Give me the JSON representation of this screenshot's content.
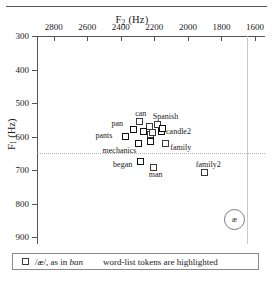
{
  "chart_data": {
    "type": "scatter",
    "title": "",
    "xlabel": "F2 (Hz)",
    "ylabel": "F1 (Hz)",
    "xlabel_main": "F",
    "xlabel_sub": "2",
    "xlabel_unit": " (Hz)",
    "ylabel_main": "F",
    "ylabel_sub": "1",
    "ylabel_unit": " (Hz)",
    "xlim": [
      2900,
      1540
    ],
    "ylim": [
      300,
      920
    ],
    "x_axis_position": "top",
    "y_axis_direction": "inverted",
    "grid": false,
    "legend_position": "below-plot",
    "xticks": [
      2800,
      2600,
      2400,
      2200,
      2000,
      1800,
      1600
    ],
    "xtick_labels": [
      "2800",
      "2600",
      "2400",
      "2200",
      "2000",
      "1800",
      "1600"
    ],
    "yticks": [
      300,
      400,
      500,
      600,
      700,
      800,
      900
    ],
    "ytick_labels": [
      "300",
      "400",
      "500",
      "600",
      "700",
      "800",
      "900"
    ],
    "reference_lines": [
      {
        "orientation": "vertical",
        "value": 1650,
        "style": "solid-light"
      },
      {
        "orientation": "horizontal",
        "value": 650,
        "style": "dotted"
      }
    ],
    "points": [
      {
        "label": "can",
        "f2": 2290,
        "f1": 552,
        "highlighted": false,
        "label_dx": -4,
        "label_dy": -11
      },
      {
        "label": "pan",
        "f2": 2330,
        "f1": 576,
        "highlighted": true,
        "label_dx": -21,
        "label_dy": -9
      },
      {
        "label": "",
        "f2": 2232,
        "f1": 567,
        "highlighted": false,
        "label_dx": 0,
        "label_dy": 0
      },
      {
        "label": "Spanish",
        "f2": 2185,
        "f1": 562,
        "highlighted": false,
        "label_dx": -4,
        "label_dy": -11
      },
      {
        "label": "pants",
        "f2": 2378,
        "f1": 598,
        "highlighted": true,
        "label_dx": -29,
        "label_dy": -4
      },
      {
        "label": "",
        "f2": 2268,
        "f1": 583,
        "highlighted": true,
        "label_dx": 0,
        "label_dy": 0
      },
      {
        "label": "",
        "f2": 2224,
        "f1": 592,
        "highlighted": false,
        "label_dx": 0,
        "label_dy": 0
      },
      {
        "label": "",
        "f2": 2212,
        "f1": 585,
        "highlighted": false,
        "label_dx": 0,
        "label_dy": 0
      },
      {
        "label": "candle2",
        "f2": 2160,
        "f1": 582,
        "highlighted": true,
        "label_dx": 5,
        "label_dy": -3
      },
      {
        "label": "",
        "f2": 2152,
        "f1": 575,
        "highlighted": true,
        "label_dx": 0,
        "label_dy": 0
      },
      {
        "label": "mechanics",
        "f2": 2300,
        "f1": 620,
        "highlighted": true,
        "label_dx": -35,
        "label_dy": 4
      },
      {
        "label": "",
        "f2": 2225,
        "f1": 612,
        "highlighted": true,
        "label_dx": 0,
        "label_dy": 0
      },
      {
        "label": "family",
        "f2": 2135,
        "f1": 618,
        "highlighted": false,
        "label_dx": 5,
        "label_dy": 1
      },
      {
        "label": "began",
        "f2": 2285,
        "f1": 672,
        "highlighted": true,
        "label_dx": -27,
        "label_dy": 0
      },
      {
        "label": "man",
        "f2": 2210,
        "f1": 690,
        "highlighted": false,
        "label_dx": -4,
        "label_dy": 4
      },
      {
        "label": "family2",
        "f2": 1905,
        "f1": 705,
        "highlighted": false,
        "label_dx": -8,
        "label_dy": -11
      }
    ],
    "annotations": [
      {
        "text": "æ",
        "f2": 1725,
        "f1": 845,
        "style": "circled"
      }
    ]
  },
  "legend": {
    "symbol": "square",
    "key_prefix": "/æ/, as in ",
    "key_italic": "ban",
    "note": "word-list tokens are highlighted"
  }
}
